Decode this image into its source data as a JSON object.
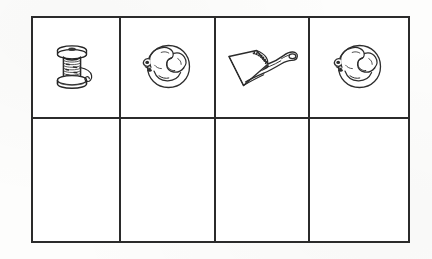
{
  "page": {
    "background_color": "#fdfdfc",
    "ink_color": "#2b2b2b",
    "paper_color": "#ffffff"
  },
  "grid": {
    "columns": 4,
    "rows": 2,
    "border_color": "#2b2b2b",
    "border_width_px": 2.2,
    "bounds": {
      "x": 31,
      "y": 16,
      "width": 379,
      "height": 227
    },
    "column_widths_px": [
      88,
      95,
      94,
      98
    ],
    "row_heights_px": [
      101,
      122
    ],
    "vertical_divider_x": [
      121,
      216,
      312
    ],
    "horizontal_divider_y": [
      119
    ]
  },
  "cells": {
    "top_row": [
      {
        "index": 1,
        "icon": "thread-spool-icon",
        "label": "spool of thread",
        "description": "Wooden spool with wound thread and a loose curling thread tail trailing to the right",
        "style": "black and white line art"
      },
      {
        "index": 2,
        "icon": "curled-squirrel-icon",
        "label": "curled squirrel",
        "description": "Small animal curled into a round ball shape, head at lower left, tail wrapped across body",
        "style": "black and white line art"
      },
      {
        "index": 3,
        "icon": "dustpan-icon",
        "label": "dustpan",
        "description": "Dustpan with flat scoop, textured front lip and a handle with a hanging hole",
        "style": "black and white line art"
      },
      {
        "index": 4,
        "icon": "curled-squirrel-icon",
        "label": "curled squirrel",
        "description": "Small animal curled into a round ball shape, head at lower left, tail wrapped across body",
        "style": "black and white line art"
      }
    ],
    "bottom_row": [
      {
        "index": 1,
        "label": "",
        "description": "blank answer cell"
      },
      {
        "index": 2,
        "label": "",
        "description": "blank answer cell"
      },
      {
        "index": 3,
        "label": "",
        "description": "blank answer cell"
      },
      {
        "index": 4,
        "label": "",
        "description": "blank answer cell"
      }
    ]
  }
}
